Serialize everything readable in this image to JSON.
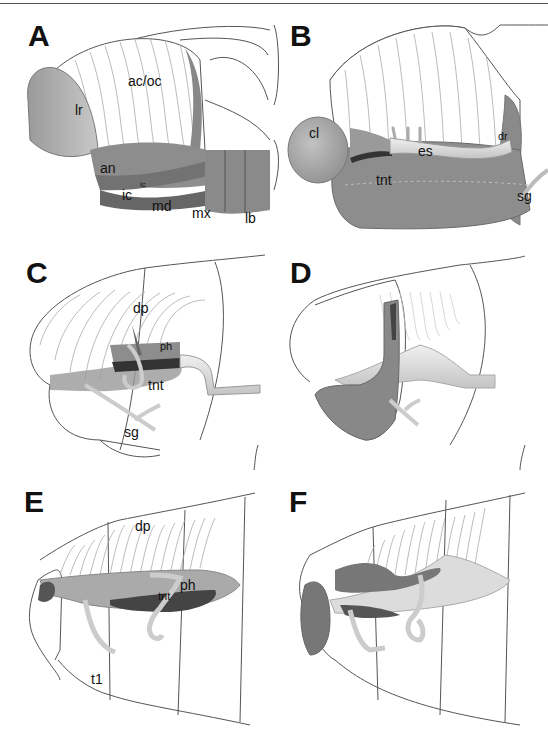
{
  "figure": {
    "panels": [
      {
        "id": "A",
        "labels": [
          "ac/oc",
          "lr",
          "an",
          "ic",
          "ic",
          "md",
          "mx",
          "lb"
        ]
      },
      {
        "id": "B",
        "labels": [
          "cl",
          "es",
          "dr",
          "tnt",
          "sg"
        ]
      },
      {
        "id": "C",
        "labels": [
          "dp",
          "ph",
          "tnt",
          "sg"
        ]
      },
      {
        "id": "D",
        "labels": []
      },
      {
        "id": "E",
        "labels": [
          "dp",
          "ph",
          "tnt",
          "t1"
        ]
      },
      {
        "id": "F",
        "labels": []
      }
    ]
  },
  "colors": {
    "dark": "#666666",
    "mid": "#8a8a8a",
    "light": "#bdbdbd",
    "tube": "#dedede",
    "outline": "#555555"
  }
}
